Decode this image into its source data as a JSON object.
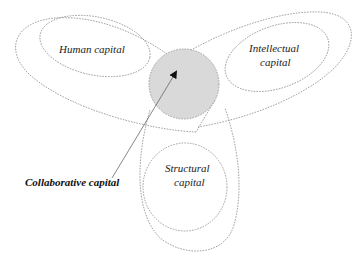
{
  "diagram": {
    "labels": {
      "human": "Human capital",
      "intellectual_line1": "Intellectual",
      "intellectual_line2": "capital",
      "structural_line1": "Structural",
      "structural_line2": "capital",
      "collaborative": "Collaborative capital"
    },
    "colors": {
      "center_fill": "#d9d9d9",
      "center_stroke": "#8a8a8a",
      "outline": "#8a8a8a",
      "arrow": "#555555",
      "text": "#222222"
    },
    "nodes": [
      {
        "id": "human",
        "label": "Human capital"
      },
      {
        "id": "intellectual",
        "label": "Intellectual capital"
      },
      {
        "id": "structural",
        "label": "Structural capital"
      },
      {
        "id": "collaborative",
        "label": "Collaborative capital",
        "position": "center overlap"
      }
    ],
    "edges": [
      {
        "from": "collaborative-label",
        "to": "center-circle",
        "type": "arrow"
      }
    ]
  }
}
